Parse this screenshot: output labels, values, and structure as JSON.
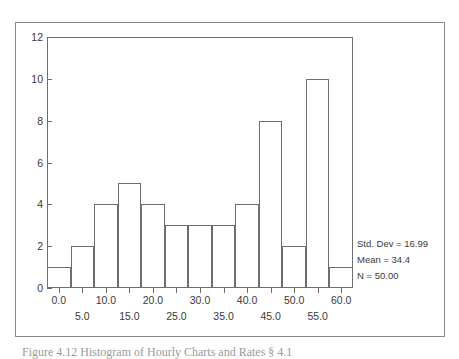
{
  "figure": {
    "caption": "Figure 4.12  Histogram of Hourly Charts and Rates § 4.1"
  },
  "stats": {
    "std_dev": "Std. Dev = 16.99",
    "mean": "Mean = 34.4",
    "n": "N = 50.00"
  },
  "chart_data": {
    "type": "bar",
    "title": "",
    "subtitle": "",
    "xlabel": "",
    "ylabel": "",
    "grid": false,
    "legend_position": "right",
    "bin_width": 5,
    "xlim": [
      -2.5,
      62.5
    ],
    "ylim": [
      0,
      12
    ],
    "categories": [
      "0.0",
      "5.0",
      "10.0",
      "15.0",
      "20.0",
      "25.0",
      "30.0",
      "35.0",
      "40.0",
      "45.0",
      "50.0",
      "55.0",
      "60.0"
    ],
    "bin_centers": [
      0,
      5,
      10,
      15,
      20,
      25,
      30,
      35,
      40,
      45,
      50,
      55,
      60
    ],
    "values": [
      1,
      2,
      4,
      5,
      4,
      3,
      3,
      3,
      4,
      8,
      2,
      10,
      1
    ],
    "x_tick_labels_row1": [
      "0.0",
      "10.0",
      "20.0",
      "30.0",
      "40.0",
      "50.0",
      "60.0"
    ],
    "x_tick_values_row1": [
      0,
      10,
      20,
      30,
      40,
      50,
      60
    ],
    "x_tick_labels_row2": [
      "5.0",
      "15.0",
      "25.0",
      "35.0",
      "45.0",
      "55.0"
    ],
    "x_tick_values_row2": [
      5,
      15,
      25,
      35,
      45,
      55
    ],
    "y_tick_labels": [
      "0",
      "2",
      "4",
      "6",
      "8",
      "10",
      "12"
    ],
    "y_tick_values": [
      0,
      2,
      4,
      6,
      8,
      10,
      12
    ],
    "annotations": [
      "Std. Dev = 16.99",
      "Mean = 34.4",
      "N = 50.00"
    ],
    "total_count": 50,
    "statistics": {
      "std_dev": 16.99,
      "mean": 34.4,
      "n": 50.0
    }
  }
}
